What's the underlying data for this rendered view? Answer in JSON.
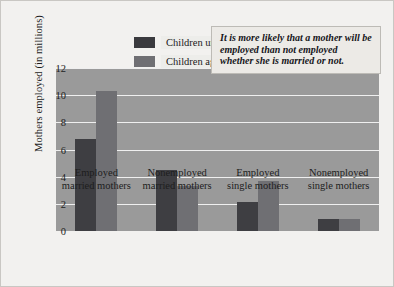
{
  "chart_data": {
    "type": "bar",
    "title": "",
    "xlabel": "",
    "ylabel": "Mothers employed (in millions)",
    "ylim": [
      0,
      12
    ],
    "yticks": [
      0,
      2,
      4,
      6,
      8,
      10,
      12
    ],
    "grid": true,
    "legend_position": "inside-top-center",
    "categories": [
      "Employed\nmarried mothers",
      "Nonemployed\nmarried mothers",
      "Employed\nsingle mothers",
      "Nonemployed\nsingle mothers"
    ],
    "series": [
      {
        "name": "Children under age 6",
        "color": "#3e3e42",
        "values": [
          6.8,
          4.5,
          2.1,
          0.85
        ]
      },
      {
        "name": "Children ages 6–17",
        "color": "#6f6f73",
        "values": [
          10.3,
          3.35,
          3.7,
          0.9
        ]
      }
    ],
    "annotations": [
      "It is more likely that a mother will be employed than not employed whether she is married or not."
    ]
  },
  "legend": {
    "items": [
      {
        "label": "Children under age 6"
      },
      {
        "label": "Children ages 6–17"
      }
    ]
  },
  "callout": {
    "text": "It is more likely that a mother will be employed than not employed whether she is married or not."
  },
  "axis": {
    "y_title": "Mothers employed (in millions)",
    "y_ticks": [
      "12",
      "10",
      "8",
      "6",
      "4",
      "2",
      "0"
    ]
  },
  "colors": {
    "series_dark": "#3e3e42",
    "series_light": "#6f6f73",
    "plot_background": "#9a9a9a",
    "gridline": "#efefef",
    "page_background": "#f2f1ef"
  }
}
